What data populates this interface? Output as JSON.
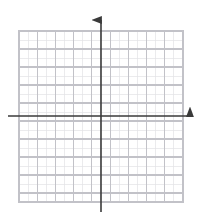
{
  "figure": {
    "title": "",
    "type": "blank-cartesian-grid",
    "background_color": "#ffffff",
    "width": 201,
    "height": 220
  },
  "grid": {
    "name": "coordinate-grid",
    "left": 19,
    "top": 31,
    "right": 183,
    "bottom": 202,
    "columns": 18,
    "rows": 19,
    "cell_width": 9.11,
    "cell_height": 9.0,
    "minor_color": "#e2e2e6",
    "major_color": "#c2c2c8",
    "major_every": 2,
    "minor_width": 0.7,
    "major_width": 1.2,
    "border_color": "#c2c2c8"
  },
  "axes": {
    "color": "#3a3a3a",
    "line_width": 1.6,
    "x_axis": {
      "name": "x-axis",
      "y": 116,
      "start_x": 8,
      "end_x": 190,
      "arrow": "right",
      "arrow_tip_x": 196,
      "label": "",
      "ticks": []
    },
    "y_axis": {
      "name": "y-axis",
      "x": 101,
      "start_y": 212,
      "end_y": 20,
      "arrow": "up",
      "arrow_tip_y": 13,
      "label": "",
      "ticks": []
    },
    "origin": {
      "x": 101,
      "y": 116
    }
  },
  "chart_data": {
    "type": "scatter",
    "title": "",
    "xlabel": "",
    "ylabel": "",
    "series": [],
    "x": [],
    "values": [],
    "xlim": [
      -9,
      9
    ],
    "ylim": [
      -9.5,
      9.5
    ],
    "grid": true,
    "legend": "none",
    "annotations": [],
    "tick_labels": {
      "x": [],
      "y": []
    }
  }
}
